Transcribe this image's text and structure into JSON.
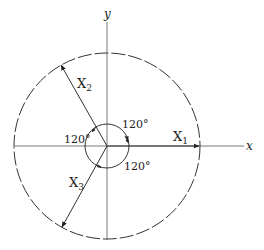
{
  "diagram": {
    "axes": {
      "x_label": "x",
      "y_label": "y"
    },
    "vectors": [
      {
        "label": "X",
        "subscript": "1",
        "angle_deg": 0
      },
      {
        "label": "X",
        "subscript": "2",
        "angle_deg": 120
      },
      {
        "label": "X",
        "subscript": "3",
        "angle_deg": 240
      }
    ],
    "angles": [
      {
        "label": "120°",
        "position": "upper-right"
      },
      {
        "label": "120°",
        "position": "left"
      },
      {
        "label": "120°",
        "position": "lower-right"
      }
    ],
    "outer_circle": {
      "style": "dashed"
    },
    "inner_circle": {
      "style": "solid"
    },
    "colors": {
      "stroke": "#333333",
      "background": "#ffffff"
    }
  }
}
